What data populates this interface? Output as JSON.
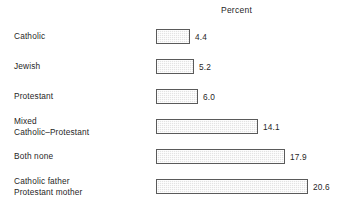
{
  "chart": {
    "title": "Percent"
  },
  "chart_data": {
    "type": "bar",
    "orientation": "horizontal",
    "title": "Percent",
    "xlabel": "Percent",
    "ylabel": "",
    "grid": false,
    "legend": null,
    "xlim": [
      0,
      20.6
    ],
    "categories": [
      "Catholic",
      "Jewish",
      "Protestant",
      "Mixed Catholic–Protestant",
      "Both none",
      "Catholic father Protestant mother"
    ],
    "values": [
      4.4,
      5.2,
      6.0,
      14.1,
      17.9,
      20.6
    ],
    "bars": [
      {
        "label_lines": [
          "Catholic"
        ],
        "value": 4.4,
        "value_label": "4.4",
        "bar_px": 34
      },
      {
        "label_lines": [
          "Jewish"
        ],
        "value": 5.2,
        "value_label": "5.2",
        "bar_px": 38
      },
      {
        "label_lines": [
          "Protestant"
        ],
        "value": 6.0,
        "value_label": "6.0",
        "bar_px": 42
      },
      {
        "label_lines": [
          "Mixed",
          "Catholic–Protestant"
        ],
        "value": 14.1,
        "value_label": "14.1",
        "bar_px": 102
      },
      {
        "label_lines": [
          "Both none"
        ],
        "value": 17.9,
        "value_label": "17.9",
        "bar_px": 129
      },
      {
        "label_lines": [
          "Catholic father",
          "Protestant mother"
        ],
        "value": 20.6,
        "value_label": "20.6",
        "bar_px": 152
      }
    ],
    "colors": {
      "background": "#ffffff",
      "bar_fill": "#e3e3e3",
      "bar_border": "#5a5a5a",
      "text": "#1f1f1f"
    }
  }
}
